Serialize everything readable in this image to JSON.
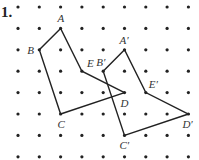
{
  "problem_number": "1.",
  "grid": {
    "cols": 9,
    "rows": 8,
    "origin_x": 18,
    "origin_y": 7,
    "spacing_x": 21.3,
    "spacing_y": 21.4,
    "dot_color": "#222222"
  },
  "line_color": "#222222",
  "figures": [
    {
      "name": "original",
      "vertices": [
        {
          "label": "A",
          "col": 2,
          "row": 1,
          "lx": -3,
          "ly": -6
        },
        {
          "label": "B",
          "col": 1,
          "row": 2,
          "lx": -12,
          "ly": 4
        },
        {
          "label": "C",
          "col": 2,
          "row": 5,
          "lx": -3,
          "ly": 14
        },
        {
          "label": "D",
          "col": 5,
          "row": 4,
          "lx": -4,
          "ly": 14
        },
        {
          "label": "E",
          "col": 3,
          "row": 3,
          "lx": 5,
          "ly": -4
        }
      ]
    },
    {
      "name": "image",
      "vertices": [
        {
          "label": "A′",
          "col": 5,
          "row": 2,
          "lx": -5,
          "ly": -6
        },
        {
          "label": "B′",
          "col": 4,
          "row": 3,
          "lx": -7,
          "ly": -5
        },
        {
          "label": "C′",
          "col": 5,
          "row": 6,
          "lx": -5,
          "ly": 14
        },
        {
          "label": "D′",
          "col": 8,
          "row": 5,
          "lx": -6,
          "ly": 14
        },
        {
          "label": "E′",
          "col": 6,
          "row": 4,
          "lx": 3,
          "ly": -5
        }
      ]
    }
  ]
}
